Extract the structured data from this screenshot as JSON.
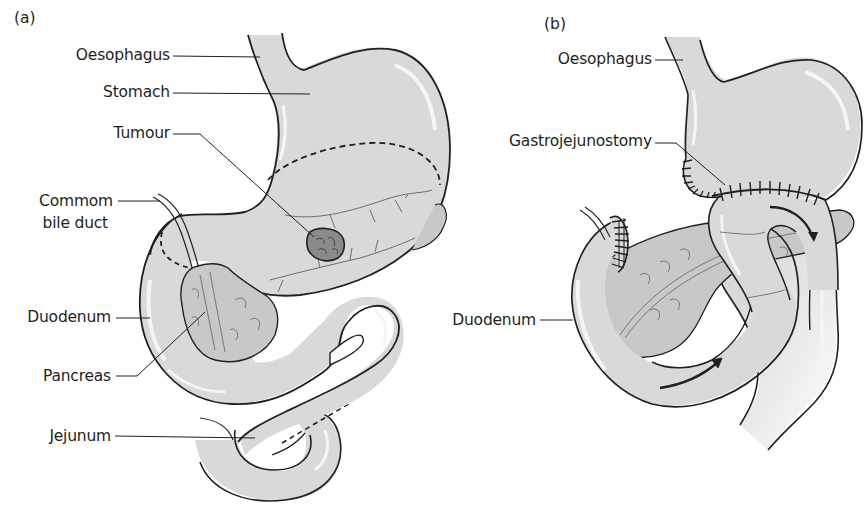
{
  "figure": {
    "panels": [
      {
        "id": "a",
        "tag": "(a)",
        "labels": {
          "oesophagus": "Oesophagus",
          "stomach": "Stomach",
          "tumour": "Tumour",
          "common_bile_duct_line1": "Commom",
          "common_bile_duct_line2": "bile duct",
          "duodenum": "Duodenum",
          "pancreas": "Pancreas",
          "jejunum": "Jejunum"
        }
      },
      {
        "id": "b",
        "tag": "(b)",
        "labels": {
          "oesophagus": "Oesophagus",
          "gastrojejunostomy": "Gastrojejunostomy",
          "duodenum": "Duodenum"
        }
      }
    ],
    "colors": {
      "organ_fill": "#d9d9d9",
      "organ_highlight": "#f2f2f2",
      "pancreas_fill": "#c8c8c8",
      "tumour_fill": "#8a8a8a",
      "outline": "#231f20",
      "background": "#ffffff"
    }
  }
}
